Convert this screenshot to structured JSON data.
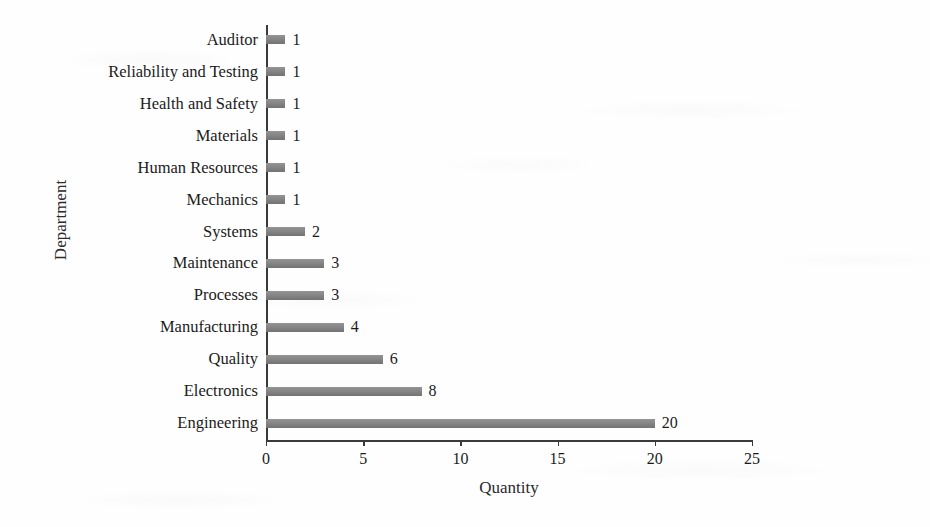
{
  "chart_data": {
    "type": "bar",
    "orientation": "horizontal",
    "title": "",
    "xlabel": "Quantity",
    "ylabel": "Department",
    "categories": [
      "Auditor",
      "Reliability and Testing",
      "Health and Safety",
      "Materials",
      "Human Resources",
      "Mechanics",
      "Systems",
      "Maintenance",
      "Processes",
      "Manufacturing",
      "Quality",
      "Electronics",
      "Engineering"
    ],
    "values": [
      1,
      1,
      1,
      1,
      1,
      1,
      2,
      3,
      3,
      4,
      6,
      8,
      20
    ],
    "value_labels": [
      "1",
      "1",
      "1",
      "1",
      "1",
      "1",
      "2",
      "3",
      "3",
      "4",
      "6",
      "8",
      "20"
    ],
    "xlim": [
      0,
      25
    ],
    "xticks": [
      0,
      5,
      10,
      15,
      20,
      25
    ],
    "xtick_labels": [
      "0",
      "5",
      "10",
      "15",
      "20",
      "25"
    ],
    "grid": false,
    "legend": false,
    "bar_color": "#808080",
    "axis_color": "#3a3a3a",
    "text_color": "#1b1b1b",
    "background": "#fefefe"
  }
}
